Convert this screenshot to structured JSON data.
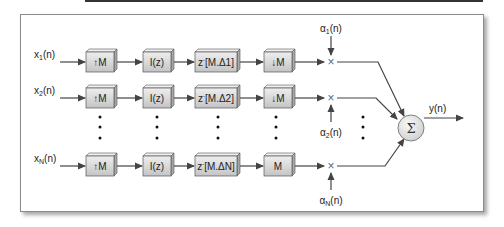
{
  "diagram": {
    "type": "block-diagram",
    "rows": [
      {
        "input": "x1(n)",
        "input_base": "x",
        "input_sub": "1",
        "blocks": [
          "↑M",
          "I(z)",
          "z⁻[M.Δ1]",
          "↓M"
        ],
        "z_label": "z",
        "z_sup": "-",
        "z_arg": "[M.Δ1]",
        "weight_base": "α",
        "weight_sub": "1"
      },
      {
        "input": "x2(n)",
        "input_base": "x",
        "input_sub": "2",
        "blocks": [
          "↑M",
          "I(z)",
          "z⁻[M.Δ2]",
          "↓M"
        ],
        "z_label": "z",
        "z_sup": "-",
        "z_arg": "[M.Δ2]",
        "weight_base": "α",
        "weight_sub": "2"
      },
      {
        "input": "xN(n)",
        "input_base": "x",
        "input_sub": "N",
        "blocks": [
          "↑M",
          "I(z)",
          "z⁻[M.ΔN]",
          "M"
        ],
        "z_label": "z",
        "z_sup": "-",
        "z_arg": "[M.ΔN]",
        "weight_base": "α",
        "weight_sub": "N"
      }
    ],
    "labels": {
      "arg": "(n)",
      "upsample": "↑M",
      "filter": "I(z)",
      "downsample": "↓M",
      "downsample_last": "M",
      "sum_symbol": "Σ",
      "output": "y(n)",
      "multiply_symbol": "×"
    },
    "colors": {
      "box_face": "#d8d8d8",
      "box_top": "#efefef",
      "box_side": "#a8a8a8",
      "line": "#444444",
      "sum_fill": "#e6e6e6"
    }
  }
}
